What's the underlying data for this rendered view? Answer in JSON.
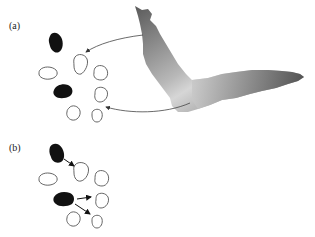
{
  "labels": {
    "panel_a": "(a)",
    "panel_b": "(b)"
  },
  "colors": {
    "cell_outline": "#555555",
    "dark_cell": "#111111",
    "arrow": "#444444",
    "shape_dark": "#555555",
    "shape_light": "#dddddd"
  },
  "panels": [
    {
      "id": "a",
      "description": "Signal from distant gray shape reaches outline cells via curved arrows",
      "dark_cells": 2,
      "outline_cells": 6,
      "arrows": 2
    },
    {
      "id": "b",
      "description": "Dark cells signal to adjacent outline cells via short straight arrows",
      "dark_cells": 2,
      "outline_cells": 6,
      "arrows": 3
    }
  ]
}
